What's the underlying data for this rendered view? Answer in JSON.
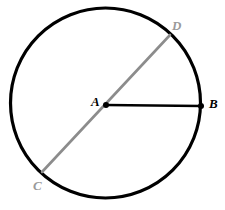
{
  "figure": {
    "canvas": {
      "width": 225,
      "height": 210,
      "background": "#ffffff"
    },
    "circle": {
      "name": "circle-A",
      "center_x": 105.5,
      "center_y": 103,
      "radius": 95,
      "stroke_color": "#000000",
      "stroke_width": 3.2,
      "fill": "none"
    },
    "segments": [
      {
        "name": "diameter-CD",
        "from": "C",
        "to": "D",
        "x1": 42,
        "y1": 172,
        "x2": 170,
        "y2": 35,
        "stroke_color": "#8c8c8c",
        "stroke_width": 2.6
      },
      {
        "name": "radius-AB",
        "from": "A",
        "to": "B",
        "x1": 106,
        "y1": 105,
        "x2": 201,
        "y2": 106,
        "stroke_color": "#000000",
        "stroke_width": 2.6
      }
    ],
    "points": [
      {
        "id": "A",
        "label": "A",
        "x": 106,
        "y": 105,
        "dot": true,
        "dot_radius": 3.0,
        "color": "#000000",
        "label_color": "#000000"
      },
      {
        "id": "B",
        "label": "B",
        "x": 201,
        "y": 106,
        "dot": true,
        "dot_radius": 3.0,
        "color": "#000000",
        "label_color": "#000000"
      },
      {
        "id": "C",
        "label": "C",
        "x": 42,
        "y": 172,
        "dot": false,
        "dot_radius": 0,
        "color": "#8c8c8c",
        "label_color": "#9a9a9a"
      },
      {
        "id": "D",
        "label": "D",
        "x": 170,
        "y": 35,
        "dot": false,
        "dot_radius": 0,
        "color": "#8c8c8c",
        "label_color": "#9a9a9a"
      }
    ],
    "colors": {
      "circle_stroke": "#000000",
      "diameter_stroke": "#8c8c8c",
      "radius_stroke": "#000000",
      "label_dark": "#000000",
      "label_gray": "#9a9a9a",
      "background": "#ffffff"
    }
  }
}
